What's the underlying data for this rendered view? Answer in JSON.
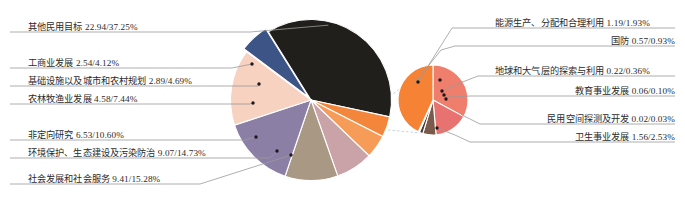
{
  "chart_data": {
    "type": "pie",
    "title": "",
    "subtitle": "",
    "xlabel": "",
    "ylabel": "",
    "legend_position": "labels-with-leader-lines",
    "grid": false,
    "note": "Pie-of-pie chart. Main pie has 8 wedges; the small dark-blue wedge of the main pie is expanded into the secondary pie on the right which holds 6 small categories.",
    "value_format": "name value/percent%",
    "main_pie": {
      "name": "main-pie",
      "categories": [
        "其他民用目标",
        "工商业发展",
        "基础设施以及城市和农村规划",
        "农林牧渔业发展",
        "非定向研究",
        "环境保护、生态建设及污染防治",
        "社会发展和社会服务",
        "其他（展开至副饼）"
      ],
      "values": [
        22.94,
        2.54,
        2.89,
        4.58,
        6.53,
        9.07,
        9.41,
        3.62
      ],
      "percents": [
        37.25,
        4.12,
        4.69,
        7.44,
        10.6,
        14.73,
        15.28,
        5.88
      ],
      "colors": [
        "#211f1c",
        "#f4863c",
        "#f79c58",
        "#c9a3a8",
        "#a99884",
        "#8b7fa6",
        "#f7d2c0",
        "#3c5486"
      ]
    },
    "secondary_pie": {
      "name": "secondary-pie",
      "categories": [
        "能源生产、分配和合理利用",
        "国防",
        "地球和大气层的探索与利用",
        "教育事业发展",
        "民用空间探测及开发",
        "卫生事业发展"
      ],
      "values": [
        1.19,
        0.57,
        0.22,
        0.06,
        0.02,
        1.56
      ],
      "percents": [
        1.93,
        0.93,
        0.36,
        0.1,
        0.03,
        2.53
      ],
      "colors": [
        "#ef7f6c",
        "#e8726f",
        "#7a5a4a",
        "#4a3a32",
        "#2b2723",
        "#f58235"
      ]
    }
  },
  "labels_left": [
    {
      "text": "其他民用目标 22.94/37.25%"
    },
    {
      "text": "工商业发展 2.54/4.12%"
    },
    {
      "text": "基础设施以及城市和农村规划 2.89/4.69%"
    },
    {
      "text": "农林牧渔业发展 4.58/7.44%"
    },
    {
      "text": "非定向研究 6.53/10.60%"
    },
    {
      "text": "环境保护、生态建设及污染防治 9.07/14.73%"
    },
    {
      "text": "社会发展和社会服务 9.41/15.28%"
    }
  ],
  "labels_right": [
    {
      "text": "能源生产、分配和合理利用 1.19/1.93%"
    },
    {
      "text": "国防 0.57/0.93%"
    },
    {
      "text": "地球和大气层的探索与利用 0.22/0.36%"
    },
    {
      "text": "教育事业发展 0.06/0.10%"
    },
    {
      "text": "民用空间探测及开发 0.02/0.03%"
    },
    {
      "text": "卫生事业发展 1.56/2.53%"
    }
  ],
  "colors": {
    "background": "#ffffff",
    "text": "#2b2b2b",
    "leader_line": "#9a9a9a",
    "underline": "#cfcfcf",
    "marker": "#1a1a1a"
  }
}
